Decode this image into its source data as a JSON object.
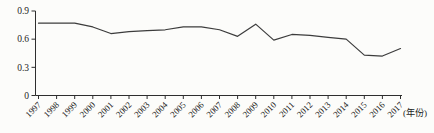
{
  "chart_data": {
    "type": "line",
    "title": "",
    "x": [
      "1997",
      "1998",
      "1999",
      "2000",
      "2001",
      "2002",
      "2003",
      "2004",
      "2005",
      "2006",
      "2007",
      "2008",
      "2009",
      "2010",
      "2011",
      "2012",
      "2013",
      "2014",
      "2015",
      "2016",
      "2017"
    ],
    "values": [
      0.77,
      0.77,
      0.77,
      0.73,
      0.66,
      0.68,
      0.69,
      0.7,
      0.73,
      0.73,
      0.7,
      0.63,
      0.76,
      0.59,
      0.65,
      0.64,
      0.62,
      0.6,
      0.43,
      0.42,
      0.5
    ],
    "xlabel": "(年份)",
    "ylabel": "",
    "ylim": [
      0,
      0.9
    ],
    "yticks": [
      0,
      0.3,
      0.6,
      0.9
    ],
    "ytick_labels": [
      "0",
      "0.3",
      "0.6",
      "0.9"
    ],
    "x_label_rotation": -45,
    "grid": false,
    "legend": "none",
    "line_color": "#3c3c3c",
    "axis_color": "#2e2e2e",
    "text_color": "#1c1c1c",
    "background_color": "#fcfcfa"
  }
}
